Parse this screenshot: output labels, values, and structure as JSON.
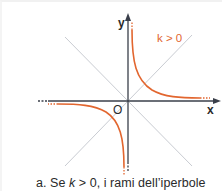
{
  "figure": {
    "axis_labels": {
      "x": "x",
      "y": "y",
      "origin": "O"
    },
    "curve_label": "k > 0",
    "colors": {
      "curve": "#e2662f",
      "axes": "#3a3f4a",
      "asymptote_diagonals": "#c9ccd2",
      "text": "#2a2a2a"
    }
  },
  "caption": {
    "prefix": "a. Se ",
    "var": "k",
    "suffix": " > 0, i rami dell’iperbole"
  }
}
